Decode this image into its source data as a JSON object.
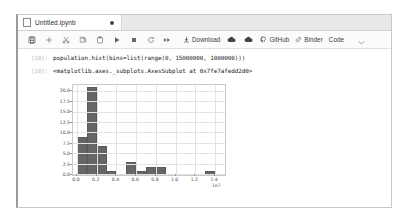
{
  "window": {
    "tab": {
      "title": "Untitled.ipynb",
      "file_icon": "notebook-file-icon",
      "dirty_indicator": "●"
    }
  },
  "toolbar": {
    "icon_buttons": [
      {
        "name": "save-button",
        "icon": "save-icon"
      },
      {
        "name": "insert-cell-button",
        "icon": "plus-icon"
      },
      {
        "name": "cut-cell-button",
        "icon": "scissors-icon"
      },
      {
        "name": "copy-cell-button",
        "icon": "copy-icon"
      },
      {
        "name": "paste-cell-button",
        "icon": "paste-icon"
      },
      {
        "name": "run-cell-button",
        "icon": "play-icon"
      },
      {
        "name": "interrupt-kernel-button",
        "icon": "stop-icon"
      },
      {
        "name": "restart-kernel-button",
        "icon": "restart-icon"
      },
      {
        "name": "restart-run-all-button",
        "icon": "fast-forward-icon"
      }
    ],
    "download_label": "Download",
    "download_icon": "download-icon",
    "cloud_upload_icon": "cloud-upload-icon",
    "cloud_download_icon": "cloud-download-icon",
    "github_label": "GitHub",
    "github_icon": "github-icon",
    "binder_label": "Binder",
    "binder_icon": "link-icon",
    "celltype_label": "Code",
    "celltype_caret": "chevron-down-icon"
  },
  "cells": [
    {
      "prompt": "[10]:",
      "source": "population.hist(bins=list(range(0, 15000000, 1000000)))"
    },
    {
      "prompt": "[10]:",
      "output_text": "<matplotlib.axes._subplots.AxesSubplot at 0x7fe7afedd2d0>"
    }
  ],
  "chart_data": {
    "type": "bar",
    "title": "",
    "xlabel": "",
    "ylabel": "",
    "x_exponent_label": "1e7",
    "xlim": [
      -400000,
      15000000
    ],
    "ylim": [
      0,
      21.5
    ],
    "grid": true,
    "bar_color": "#666666",
    "bin_width": 1000000,
    "bin_edges": [
      0,
      1000000,
      2000000,
      3000000,
      4000000,
      5000000,
      6000000,
      7000000,
      8000000,
      9000000,
      10000000,
      11000000,
      12000000,
      13000000,
      14000000,
      15000000
    ],
    "categories": [
      "0-1e6",
      "1e6-2e6",
      "2e6-3e6",
      "3e6-4e6",
      "4e6-5e6",
      "5e6-6e6",
      "6e6-7e6",
      "7e6-8e6",
      "8e6-9e6",
      "9e6-1e7",
      "1e7-1.1e7",
      "1.1e7-1.2e7",
      "1.2e7-1.3e7",
      "1.3e7-1.4e7",
      "1.4e7-1.5e7"
    ],
    "values": [
      9,
      21,
      7,
      1,
      0,
      3,
      1,
      2,
      2,
      0,
      0,
      0,
      0,
      1,
      0
    ],
    "xticks": [
      0,
      2000000,
      4000000,
      6000000,
      8000000,
      10000000,
      12000000,
      14000000
    ],
    "xtick_labels": [
      "0.0",
      "0.2",
      "0.4",
      "0.6",
      "0.8",
      "1.0",
      "1.2",
      "1.4"
    ],
    "yticks": [
      0,
      2.5,
      5,
      7.5,
      10,
      12.5,
      15,
      17.5,
      20
    ],
    "ytick_labels": [
      "0.0",
      "2.5",
      "5.0",
      "7.5",
      "10.0",
      "12.5",
      "15.0",
      "17.5",
      "20.0"
    ]
  }
}
